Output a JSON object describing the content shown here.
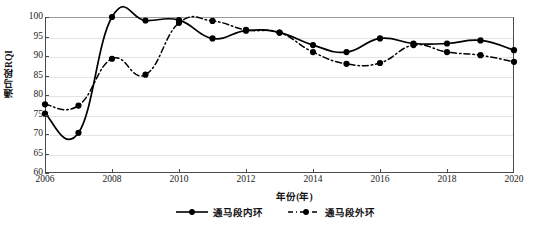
{
  "chart_data": {
    "type": "line",
    "title": "",
    "xlabel": "年份(年)",
    "ylabel": "通马段RQI",
    "x": [
      2006,
      2007,
      2008,
      2009,
      2010,
      2011,
      2012,
      2013,
      2014,
      2015,
      2016,
      2017,
      2018,
      2019,
      2020
    ],
    "xlim": [
      2006,
      2020
    ],
    "ylim": [
      60,
      100
    ],
    "xticks": [
      2006,
      2008,
      2010,
      2012,
      2014,
      2016,
      2018,
      2020
    ],
    "xtick_labels": [
      "2006",
      "2008",
      "2010",
      "2012",
      "2014",
      "2016",
      "2018",
      "2020"
    ],
    "yticks": [
      60,
      65,
      70,
      75,
      80,
      85,
      90,
      95,
      100
    ],
    "ytick_labels": [
      "60",
      "65",
      "70",
      "75",
      "80",
      "85",
      "90",
      "95",
      "100"
    ],
    "grid": true,
    "legend_position": "bottom-center",
    "series": [
      {
        "name": "通马段内环",
        "style": "solid",
        "marker": "filled-circle",
        "color": "#000000",
        "values": [
          75.2,
          70.3,
          100.0,
          99.1,
          99.2,
          94.5,
          96.5,
          96.0,
          92.8,
          91.0,
          94.5,
          93.2,
          93.2,
          94.0,
          91.5
        ]
      },
      {
        "name": "通马段外环",
        "style": "dash-dot",
        "marker": "filled-circle",
        "color": "#000000",
        "values": [
          77.6,
          77.3,
          89.3,
          85.2,
          98.5,
          99.0,
          96.7,
          96.0,
          91.0,
          88.0,
          88.2,
          92.8,
          91.0,
          90.2,
          88.5
        ]
      }
    ]
  },
  "legend": {
    "items": [
      {
        "label": "通马段内环",
        "style": "solid"
      },
      {
        "label": "通马段外环",
        "style": "dash-dot"
      }
    ]
  }
}
